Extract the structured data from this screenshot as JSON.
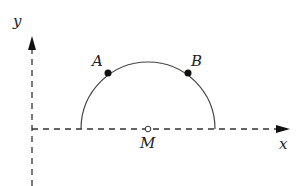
{
  "diagram": {
    "axes": {
      "x_label": "x",
      "y_label": "y"
    },
    "points": [
      {
        "name": "A",
        "filled": true
      },
      {
        "name": "B",
        "filled": true
      },
      {
        "name": "M",
        "filled": false
      }
    ],
    "shape": "semicircle centered at M on x-axis",
    "colors": {
      "stroke": "#333333",
      "point": "#111111"
    }
  }
}
